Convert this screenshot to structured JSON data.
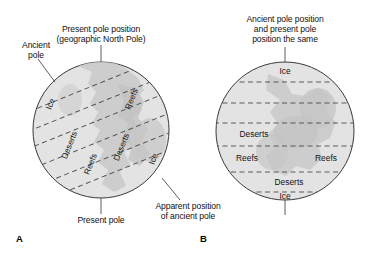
{
  "figure": {
    "width": 370,
    "height": 258,
    "background": "#ffffff",
    "globe_fill": "#e2e2e2",
    "land_fill": "#c9c9c9",
    "outline_color": "#3a3a3a",
    "dash_color": "#4a4a4a",
    "text_color": "#111111"
  },
  "panels": [
    {
      "letter": "A",
      "title_lines": [
        "Present pole position",
        "(geographic North Pole)"
      ],
      "callouts": [
        {
          "name": "ancient-pole",
          "lines": [
            "Ancient",
            "pole"
          ]
        },
        {
          "name": "present-pole",
          "lines": [
            "Present pole"
          ]
        },
        {
          "name": "apparent-position",
          "lines": [
            "Apparent position",
            "of ancient pole"
          ]
        }
      ],
      "globe": {
        "center_x": 101,
        "center_y": 130,
        "radius": 68,
        "tilt_degrees": -22,
        "band_labels": [
          "Ice",
          "Reefs",
          "Deserts",
          "Reefs",
          "Deserts",
          "Ice"
        ]
      }
    },
    {
      "letter": "B",
      "title_lines": [
        "Ancient pole position",
        "and present pole",
        "position the same"
      ],
      "callouts": [],
      "globe": {
        "center_x": 285,
        "center_y": 131,
        "radius": 69,
        "tilt_degrees": 0,
        "band_labels": [
          "Ice",
          "Deserts",
          "Reefs",
          "Reefs",
          "Deserts",
          "Ice"
        ],
        "latitude_lines": [
          82,
          103,
          123,
          146,
          172,
          192
        ]
      }
    }
  ],
  "labels": {
    "a_title_l1": "Present pole position",
    "a_title_l2": "(geographic North Pole)",
    "a_ancient_l1": "Ancient",
    "a_ancient_l2": "pole",
    "a_present_pole": "Present pole",
    "a_apparent_l1": "Apparent position",
    "a_apparent_l2": "of ancient pole",
    "a_letter": "A",
    "b_title_l1": "Ancient pole position",
    "b_title_l2": "and present pole",
    "b_title_l3": "position the same",
    "b_letter": "B",
    "a_band_ice_left": "Ice",
    "a_band_reefs_upper": "Reefs",
    "a_band_deserts_left": "Deserts",
    "a_band_reefs_lower": "Reefs",
    "a_band_deserts_right": "Deserts",
    "a_band_ice_right": "Ice",
    "b_band_ice_top": "Ice",
    "b_band_deserts_upper": "Deserts",
    "b_band_reefs_left": "Reefs",
    "b_band_reefs_right": "Reefs",
    "b_band_deserts_lower": "Deserts",
    "b_band_ice_bottom": "Ice"
  }
}
